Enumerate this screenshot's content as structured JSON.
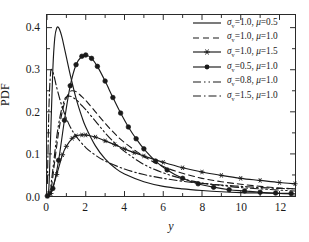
{
  "chart_data": {
    "type": "line",
    "title": "",
    "xlabel": "y",
    "ylabel": "PDF",
    "xlim": [
      0,
      12.8
    ],
    "ylim": [
      0,
      0.43
    ],
    "grid": false,
    "legend_position": "top-right",
    "xticks": [
      "0",
      "2",
      "4",
      "6",
      "8",
      "10",
      "12"
    ],
    "xtick_values": [
      0,
      2,
      4,
      6,
      8,
      10,
      12
    ],
    "yticks": [
      "0.0",
      "0.1",
      "0.2",
      "0.3",
      "0.4"
    ],
    "ytick_values": [
      0.0,
      0.1,
      0.2,
      0.3,
      0.4
    ],
    "series": [
      {
        "name": "sigma_v=1.0, mu=0.5",
        "sigma_symbol": "σ",
        "sigma_subscript": "v",
        "sigma_value": "1.0",
        "mu_symbol": "μ",
        "mu_value": "0.5",
        "style": "solid",
        "marker": "none",
        "color": "#1a1a1a",
        "peak_x": 0.6,
        "peak_y": 0.4,
        "x": [
          0.02,
          0.1,
          0.2,
          0.3,
          0.4,
          0.5,
          0.6,
          0.7,
          0.8,
          1.0,
          1.2,
          1.5,
          1.8,
          2.0,
          2.5,
          3.0,
          3.5,
          4.0,
          5.0,
          6.0,
          7.0,
          8.0,
          9.0,
          10.0,
          11.0,
          12.0,
          12.8
        ],
        "y": [
          0.0,
          0.022,
          0.16,
          0.3,
          0.375,
          0.399,
          0.4,
          0.389,
          0.372,
          0.33,
          0.288,
          0.232,
          0.188,
          0.164,
          0.119,
          0.088,
          0.067,
          0.052,
          0.034,
          0.023,
          0.017,
          0.013,
          0.01,
          0.008,
          0.007,
          0.006,
          0.005
        ]
      },
      {
        "name": "sigma_v=1.0, mu=1.0",
        "sigma_symbol": "σ",
        "sigma_subscript": "v",
        "sigma_value": "1.0",
        "mu_symbol": "μ",
        "mu_value": "1.0",
        "style": "dashed",
        "marker": "none",
        "color": "#1a1a1a",
        "peak_x": 1.3,
        "peak_y": 0.25,
        "x": [
          0.02,
          0.2,
          0.4,
          0.6,
          0.8,
          1.0,
          1.2,
          1.3,
          1.5,
          1.8,
          2.0,
          2.5,
          3.0,
          3.5,
          4.0,
          5.0,
          6.0,
          7.0,
          8.0,
          9.0,
          10.0,
          11.0,
          12.0,
          12.8
        ],
        "y": [
          0.0,
          0.013,
          0.083,
          0.152,
          0.203,
          0.233,
          0.248,
          0.25,
          0.248,
          0.236,
          0.227,
          0.2,
          0.173,
          0.148,
          0.127,
          0.094,
          0.07,
          0.054,
          0.042,
          0.034,
          0.028,
          0.023,
          0.019,
          0.017
        ]
      },
      {
        "name": "sigma_v=1.0, mu=1.5",
        "sigma_symbol": "σ",
        "sigma_subscript": "v",
        "sigma_value": "1.0",
        "mu_symbol": "μ",
        "mu_value": "1.5",
        "style": "solid",
        "marker": "star",
        "color": "#1a1a1a",
        "peak_x": 1.8,
        "peak_y": 0.145,
        "x": [
          0.02,
          0.2,
          0.5,
          0.8,
          1.0,
          1.3,
          1.5,
          1.8,
          2.0,
          2.5,
          3.0,
          3.5,
          4.0,
          4.5,
          5.0,
          6.0,
          7.0,
          8.0,
          9.0,
          10.0,
          11.0,
          12.0,
          12.8
        ],
        "y": [
          0.0,
          0.006,
          0.051,
          0.098,
          0.118,
          0.137,
          0.143,
          0.145,
          0.145,
          0.14,
          0.131,
          0.122,
          0.112,
          0.103,
          0.095,
          0.08,
          0.067,
          0.057,
          0.049,
          0.042,
          0.037,
          0.032,
          0.029
        ]
      },
      {
        "name": "sigma_v=0.5, mu=1.0",
        "sigma_symbol": "σ",
        "sigma_subscript": "v",
        "sigma_value": "0.5",
        "mu_symbol": "μ",
        "mu_value": "1.0",
        "style": "solid",
        "marker": "circle",
        "color": "#1a1a1a",
        "peak_x": 2.0,
        "peak_y": 0.335,
        "x": [
          0.02,
          0.3,
          0.6,
          0.9,
          1.2,
          1.5,
          1.8,
          2.0,
          2.3,
          2.6,
          3.0,
          3.4,
          3.8,
          4.2,
          4.6,
          5.0,
          5.6,
          6.2,
          7.0,
          7.8,
          8.6,
          9.4,
          10.2,
          11.0,
          11.8,
          12.6
        ],
        "y": [
          0.0,
          0.018,
          0.085,
          0.18,
          0.262,
          0.312,
          0.332,
          0.335,
          0.327,
          0.308,
          0.273,
          0.234,
          0.197,
          0.164,
          0.136,
          0.112,
          0.083,
          0.062,
          0.042,
          0.029,
          0.021,
          0.015,
          0.012,
          0.009,
          0.007,
          0.006
        ]
      },
      {
        "name": "sigma_v=0.8, mu=1.0",
        "sigma_symbol": "σ",
        "sigma_subscript": "v",
        "sigma_value": "0.8",
        "mu_symbol": "μ",
        "mu_value": "1.0",
        "style": "dash-dot-dot",
        "marker": "none",
        "color": "#1a1a1a",
        "peak_x": 1.0,
        "peak_y": 0.235,
        "x": [
          0.02,
          0.15,
          0.3,
          0.5,
          0.7,
          0.9,
          1.0,
          1.2,
          1.5,
          1.8,
          2.0,
          2.5,
          3.0,
          3.5,
          4.0,
          5.0,
          6.0,
          7.0,
          8.0,
          9.0,
          10.0,
          11.0,
          12.0,
          12.8
        ],
        "y": [
          0.0,
          0.01,
          0.062,
          0.14,
          0.195,
          0.228,
          0.235,
          0.237,
          0.229,
          0.215,
          0.205,
          0.178,
          0.15,
          0.126,
          0.106,
          0.075,
          0.055,
          0.041,
          0.031,
          0.025,
          0.02,
          0.017,
          0.014,
          0.012
        ]
      },
      {
        "name": "sigma_v=1.5, mu=1.0",
        "sigma_symbol": "σ",
        "sigma_subscript": "v",
        "sigma_value": "1.5",
        "mu_symbol": "μ",
        "mu_value": "1.0",
        "style": "dash-dot",
        "marker": "none",
        "color": "#1a1a1a",
        "peak_x": 0.25,
        "peak_y": 0.3,
        "x": [
          0.02,
          0.1,
          0.18,
          0.25,
          0.35,
          0.5,
          0.7,
          0.9,
          1.2,
          1.5,
          2.0,
          2.5,
          3.0,
          4.0,
          5.0,
          6.0,
          7.0,
          8.0,
          9.0,
          10.0,
          11.0,
          12.0,
          12.8
        ],
        "y": [
          0.03,
          0.21,
          0.29,
          0.3,
          0.288,
          0.258,
          0.224,
          0.196,
          0.164,
          0.142,
          0.115,
          0.097,
          0.083,
          0.064,
          0.051,
          0.042,
          0.035,
          0.03,
          0.026,
          0.023,
          0.02,
          0.018,
          0.017
        ]
      }
    ]
  }
}
